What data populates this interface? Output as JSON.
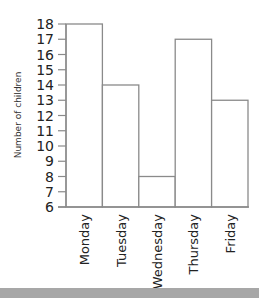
{
  "chart_data": {
    "type": "bar",
    "title": "",
    "xlabel": "",
    "ylabel": "Number of children",
    "categories": [
      "Monday",
      "Tuesday",
      "Wednesday",
      "Thursday",
      "Friday"
    ],
    "values": [
      18,
      14,
      8,
      17,
      13
    ],
    "ylim": [
      6,
      18
    ],
    "yticks": [
      6,
      7,
      8,
      9,
      10,
      11,
      12,
      13,
      14,
      15,
      16,
      17,
      18
    ],
    "grid": false,
    "legend": null,
    "bar_style": {
      "fill": "#ffffff",
      "stroke": "#8a8a8a"
    }
  },
  "colors": {
    "axis": "#8a8a8a",
    "bottom_strip": "#a7a7a7"
  }
}
